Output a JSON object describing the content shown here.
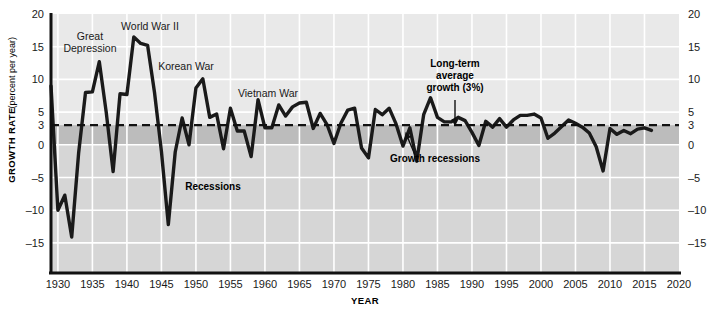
{
  "chart_data": {
    "type": "line",
    "title": "",
    "xlabel": "YEAR",
    "ylabel": "GROWTH RATE",
    "ylabel_unit": "(percent per year)",
    "xlim": [
      1929,
      2020
    ],
    "ylim": [
      -19.6,
      20
    ],
    "grid": true,
    "legend": "none",
    "x_ticks": [
      "1930",
      "1935",
      "1940",
      "1945",
      "1950",
      "1955",
      "1960",
      "1965",
      "1970",
      "1975",
      "1980",
      "1985",
      "1990",
      "1995",
      "2000",
      "2005",
      "2010",
      "2015",
      "2020"
    ],
    "x_tick_values": [
      1930,
      1935,
      1940,
      1945,
      1950,
      1955,
      1960,
      1965,
      1970,
      1975,
      1980,
      1985,
      1990,
      1995,
      2000,
      2005,
      2010,
      2015,
      2020
    ],
    "y_ticks": [
      "20",
      "15",
      "10",
      "5",
      "3",
      "0",
      "-5",
      "-10",
      "-15"
    ],
    "y_tick_values": [
      20,
      15,
      10,
      5,
      3,
      0,
      -5,
      -10,
      -15
    ],
    "reference_line": {
      "value": 3,
      "style": "dashed",
      "label": "Long-term average growth (3%)"
    },
    "bands": [
      {
        "name": "growth-recessions-band",
        "from": 0,
        "to": 3,
        "color": "#bcbcbc"
      },
      {
        "name": "recessions-band",
        "from": -19.6,
        "to": 0,
        "color": "#d6d6d6"
      }
    ],
    "series": [
      {
        "name": "Real GDP growth rate",
        "color": "#1a1a1a",
        "x": [
          1929,
          1930,
          1931,
          1932,
          1933,
          1934,
          1935,
          1936,
          1937,
          1938,
          1939,
          1940,
          1941,
          1942,
          1943,
          1944,
          1945,
          1946,
          1947,
          1948,
          1949,
          1950,
          1951,
          1952,
          1953,
          1954,
          1955,
          1956,
          1957,
          1958,
          1959,
          1960,
          1961,
          1962,
          1963,
          1964,
          1965,
          1966,
          1967,
          1968,
          1969,
          1970,
          1971,
          1972,
          1973,
          1974,
          1975,
          1976,
          1977,
          1978,
          1979,
          1980,
          1981,
          1982,
          1983,
          1984,
          1985,
          1986,
          1987,
          1988,
          1989,
          1990,
          1991,
          1992,
          1993,
          1994,
          1995,
          1996,
          1997,
          1998,
          1999,
          2000,
          2001,
          2002,
          2003,
          2004,
          2005,
          2006,
          2007,
          2008,
          2009,
          2010,
          2011,
          2012,
          2013,
          2014,
          2015,
          2016
        ],
        "values": [
          9.0,
          -10.0,
          -7.7,
          -14.1,
          -1.3,
          8.0,
          8.1,
          12.7,
          5.0,
          -4.1,
          7.8,
          7.7,
          16.5,
          15.5,
          15.2,
          8.0,
          -1.0,
          -12.2,
          -1.1,
          4.1,
          0.0,
          8.7,
          10.1,
          4.2,
          4.7,
          -0.6,
          5.6,
          2.1,
          2.1,
          -1.8,
          6.9,
          2.6,
          2.6,
          6.1,
          4.4,
          5.8,
          6.4,
          6.5,
          2.5,
          4.8,
          3.1,
          0.2,
          3.3,
          5.3,
          5.6,
          -0.5,
          -2.0,
          5.4,
          4.6,
          5.6,
          3.2,
          -0.2,
          2.6,
          -2.5,
          4.6,
          7.2,
          4.2,
          3.5,
          3.5,
          4.2,
          3.7,
          1.9,
          -0.1,
          3.6,
          2.7,
          4.0,
          2.7,
          3.8,
          4.5,
          4.5,
          4.7,
          4.1,
          1.0,
          1.8,
          2.8,
          3.8,
          3.3,
          2.7,
          1.8,
          -0.3,
          -4.0,
          2.5,
          1.6,
          2.2,
          1.7,
          2.4,
          2.6,
          2.2
        ]
      }
    ]
  },
  "annotations": [
    {
      "id": "great-depression",
      "text": "Great\nDepression",
      "lines": [
        "Great",
        "Depression"
      ],
      "x": 90,
      "y": 40,
      "style": "light"
    },
    {
      "id": "world-war-ii",
      "text": "World War II",
      "lines": [
        "World War II"
      ],
      "x": 150,
      "y": 30,
      "style": "light"
    },
    {
      "id": "korean-war",
      "text": "Korean War",
      "lines": [
        "Korean War"
      ],
      "x": 186,
      "y": 70,
      "style": "light"
    },
    {
      "id": "vietnam-war",
      "text": "Vietnam War",
      "lines": [
        "Vietnam War"
      ],
      "x": 268,
      "y": 97,
      "style": "light"
    },
    {
      "id": "long-term-average",
      "lines": [
        "Long-term",
        "average",
        "growth (3%)"
      ],
      "x": 455,
      "y": 67,
      "style": "bold"
    },
    {
      "id": "growth-recessions",
      "lines": [
        "Growth recessions"
      ],
      "x": 435,
      "y": 162,
      "style": "bold"
    },
    {
      "id": "recessions",
      "lines": [
        "Recessions"
      ],
      "x": 213,
      "y": 190,
      "style": "bold"
    }
  ],
  "colors": {
    "plot_background": "#e9e9e9",
    "grid": "#ffffff",
    "line": "#1a1a1a",
    "growth_recession_band": "#bcbcbc",
    "recession_band": "#d6d6d6",
    "axis": "#111111",
    "text": "#1a1a1a"
  }
}
